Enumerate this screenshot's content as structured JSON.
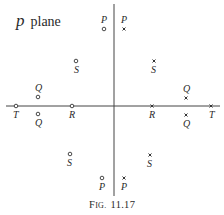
{
  "figure": {
    "title_symbol": "p",
    "title_word": "plane",
    "caption": "Fig. 11.17",
    "caption_prefix": "F",
    "caption_smallcaps": "IG.",
    "caption_number": "11.17"
  },
  "points": {
    "left_circles": [
      {
        "label": "P",
        "x": 104,
        "y": 29
      },
      {
        "label": "S",
        "x": 76,
        "y": 61
      },
      {
        "label": "Q",
        "x": 38,
        "y": 96
      },
      {
        "label": "T",
        "x": 16,
        "y": 106
      },
      {
        "label": "R",
        "x": 72,
        "y": 106
      },
      {
        "label": "Q",
        "x": 38,
        "y": 113
      },
      {
        "label": "S",
        "x": 70,
        "y": 154
      },
      {
        "label": "P",
        "x": 102,
        "y": 178
      }
    ],
    "right_crosses": [
      {
        "label": "P",
        "x": 124,
        "y": 29
      },
      {
        "label": "S",
        "x": 154,
        "y": 61
      },
      {
        "label": "Q",
        "x": 186,
        "y": 98
      },
      {
        "label": "R",
        "x": 152,
        "y": 106
      },
      {
        "label": "T",
        "x": 211,
        "y": 106
      },
      {
        "label": "Q",
        "x": 186,
        "y": 115
      },
      {
        "label": "S",
        "x": 150,
        "y": 155
      },
      {
        "label": "P",
        "x": 124,
        "y": 178
      }
    ]
  }
}
